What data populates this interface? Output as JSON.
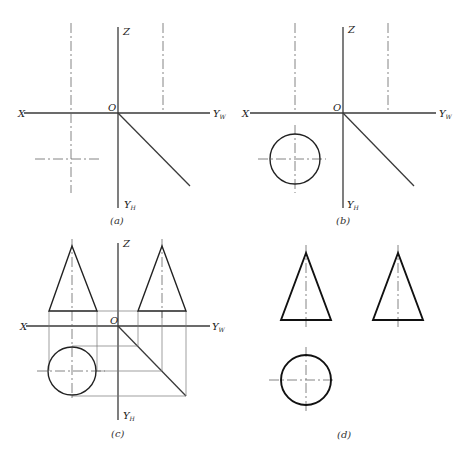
{
  "figure": {
    "panels": [
      {
        "id": "a",
        "caption": "(a)",
        "labels": {
          "x": "X",
          "z": "Z",
          "origin": "O",
          "yw": "Y",
          "yw_sub": "W",
          "yh": "Y",
          "yh_sub": "H"
        },
        "content": "Axes with center lines positioned"
      },
      {
        "id": "b",
        "caption": "(b)",
        "labels": {
          "x": "X",
          "z": "Z",
          "origin": "O",
          "yw": "Y",
          "yw_sub": "W",
          "yh": "Y",
          "yh_sub": "H"
        },
        "content": "Top view circle drawn"
      },
      {
        "id": "c",
        "caption": "(c)",
        "labels": {
          "x": "X",
          "z": "Z",
          "origin": "O",
          "yw": "Y",
          "yw_sub": "W",
          "yh": "Y",
          "yh_sub": "H"
        },
        "content": "Front and side triangle views projected with construction lines"
      },
      {
        "id": "d",
        "caption": "(d)",
        "content": "Final three views with bold outlines, axes removed"
      }
    ]
  },
  "colors": {
    "background": "#ffffff",
    "line": "#222222"
  }
}
